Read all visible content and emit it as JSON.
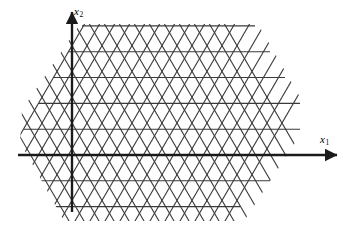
{
  "figure": {
    "kind": "lattice-diagram",
    "width": 354,
    "height": 233,
    "background_color": "#ffffff"
  },
  "axes": {
    "x1": {
      "label_text": "x",
      "label_subscript": "1",
      "orientation": "horizontal",
      "origin_x": 72,
      "origin_y": 155,
      "start_x": 18,
      "end_x": 337,
      "arrow": "right",
      "color": "#1a1a1a",
      "stroke_width": 2.4,
      "label_x": 320,
      "label_y": 134
    },
    "x2": {
      "label_text": "x",
      "label_subscript": "2",
      "orientation": "vertical",
      "origin_x": 72,
      "origin_y": 155,
      "start_y": 212,
      "end_y": 12,
      "arrow": "up",
      "color": "#1a1a1a",
      "stroke_width": 2.4,
      "label_x": 74,
      "label_y": 6
    }
  },
  "lattice": {
    "type": "triangular",
    "line_color": "#3a3a3a",
    "line_width": 1.1,
    "row_spacing": 25.8,
    "column_spacing": 30.0,
    "interior_angle_deg": 60,
    "origin_x": 72,
    "origin_y": 155,
    "row_indices": [
      -2,
      -1,
      0,
      1,
      2,
      3,
      4,
      5
    ],
    "rows": [
      {
        "index": 5,
        "y": 25.9,
        "x_start": 82,
        "x_end": 255
      },
      {
        "index": 4,
        "y": 51.7,
        "x_start": 68,
        "x_end": 270
      },
      {
        "index": 3,
        "y": 77.5,
        "x_start": 53,
        "x_end": 285
      },
      {
        "index": 2,
        "y": 103.4,
        "x_start": 39,
        "x_end": 300
      },
      {
        "index": 1,
        "y": 129.2,
        "x_start": 24,
        "x_end": 300
      },
      {
        "index": 0,
        "y": 155.0,
        "x_start": 24,
        "x_end": 285
      },
      {
        "index": -1,
        "y": 180.8,
        "x_start": 24,
        "x_end": 270
      },
      {
        "index": -2,
        "y": 206.6,
        "x_start": 24,
        "x_end": 240
      }
    ],
    "diagonal_up_count": 14,
    "diagonal_down_count": 14,
    "clip_polygon": [
      [
        80,
        24
      ],
      [
        258,
        24
      ],
      [
        304,
        104
      ],
      [
        302,
        132
      ],
      [
        244,
        221
      ],
      [
        64,
        221
      ],
      [
        20,
        142
      ],
      [
        22,
        110
      ]
    ]
  },
  "legend": {
    "present": false
  }
}
